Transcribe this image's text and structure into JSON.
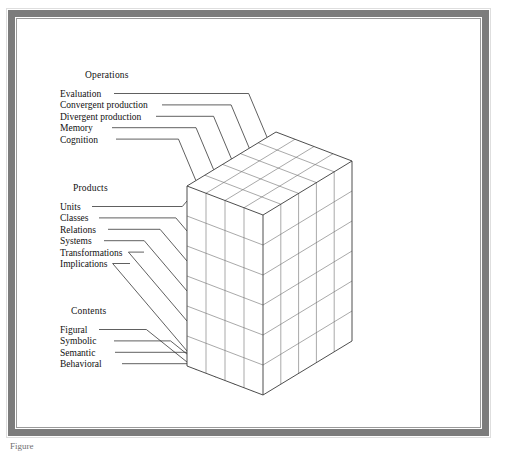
{
  "figure": {
    "caption_fragment": "Figure"
  },
  "axes": {
    "operations": {
      "heading": "Operations",
      "items": [
        "Evaluation",
        "Convergent production",
        "Divergent production",
        "Memory",
        "Cognition"
      ]
    },
    "products": {
      "heading": "Products",
      "items": [
        "Units",
        "Classes",
        "Relations",
        "Systems",
        "Transformations",
        "Implications"
      ]
    },
    "contents": {
      "heading": "Contents",
      "items": [
        "Figural",
        "Symbolic",
        "Semantic",
        "Behavioral"
      ]
    }
  },
  "cube": {
    "operations_divisions": 5,
    "products_divisions": 6,
    "contents_divisions": 4
  },
  "colors": {
    "frame": "#7c7c7c",
    "line": "#2b2b2b",
    "grid": "#6e6e6e",
    "paper": "#ffffff"
  }
}
